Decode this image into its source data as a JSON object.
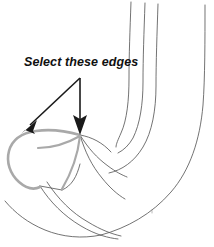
{
  "figure": {
    "background_color": "#ffffff",
    "width": 214,
    "height": 247
  },
  "annotation": {
    "label": "Select these edges",
    "text_color": "#101010",
    "font_weight": "bold",
    "font_style": "italic",
    "arrows": [
      {
        "name": "arrow-to-left-edge",
        "from": [
          80,
          78
        ],
        "to": [
          23,
          133
        ],
        "direction": "down-left",
        "color": "#1a1a1a"
      },
      {
        "name": "arrow-to-vertex",
        "from": [
          80,
          78
        ],
        "to": [
          80,
          133
        ],
        "direction": "down",
        "color": "#1a1a1a"
      }
    ]
  },
  "model": {
    "wireframe_color": "#5a5a5a",
    "selection_color": "#a9a9a9",
    "selection_label": "selected-edges",
    "description": "U-shaped tubular hook shown as a wireframe with longitudinal curves; left end cap face outlined in gray to indicate the selected edge loop"
  }
}
